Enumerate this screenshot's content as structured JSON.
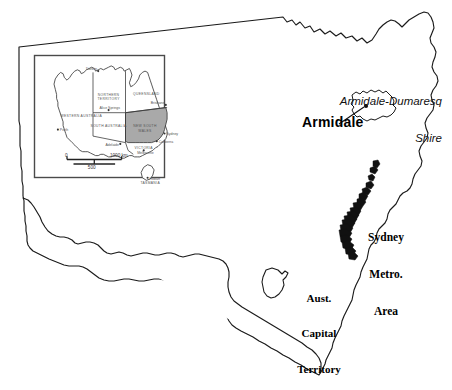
{
  "figure": {
    "kind": "reference-map",
    "background": "#ffffff",
    "outline_color": "#1a1a1a",
    "highlight_color": "#a9a9a9",
    "lga_fill_color": "#111111"
  },
  "main_map": {
    "region": "New South Wales",
    "labels": {
      "shire": "Armidale-Dumaresq\nShire",
      "shire_line1": "Armidale-Dumaresq",
      "shire_line2": "Shire",
      "city": "Armidale",
      "sydney": "Sydney\nMetro.\nArea",
      "sydney_line1": "Sydney",
      "sydney_line2": "Metro.",
      "sydney_line3": "Area",
      "act": "Aust.\nCapital\nTerritory",
      "act_line1": "Aust.",
      "act_line2": "Capital",
      "act_line3": "Territory"
    },
    "markers": [
      {
        "name": "Armidale",
        "type": "city-dot"
      }
    ]
  },
  "inset_map": {
    "region": "Australia",
    "highlighted_state": "NEW SOUTH WALES",
    "state_labels": [
      "WESTERN AUSTRALIA",
      "NORTHERN TERRITORY",
      "QUEENSLAND",
      "SOUTH AUSTRALIA",
      "NEW SOUTH WALES",
      "VICTORIA",
      "TASMANIA"
    ],
    "city_labels": [
      "Darwin",
      "Alice Springs",
      "Perth",
      "Adelaide",
      "Brisbane",
      "Sydney",
      "Canberra",
      "Melbourne",
      "Hobart"
    ],
    "scale_bar": {
      "zero": "0",
      "mid": "500",
      "max": "1000 km",
      "unit": "km"
    }
  }
}
